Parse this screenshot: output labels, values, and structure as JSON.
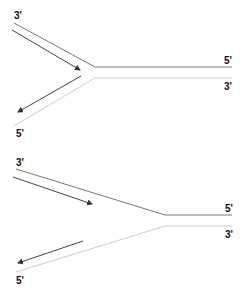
{
  "diagrams": [
    {
      "name": "fork-symmetric",
      "labels": {
        "top_left": "3'",
        "bottom_left": "5'",
        "top_right": "5'",
        "bottom_right": "3'"
      }
    },
    {
      "name": "fork-asymmetric",
      "labels": {
        "top_left": "3'",
        "bottom_left": "5'",
        "top_right": "5'",
        "bottom_right": "3'"
      }
    }
  ],
  "colors": {
    "dark_strand": "#555555",
    "light_strand": "#c8c8c8",
    "arrow": "#333333",
    "label": "#111111"
  }
}
